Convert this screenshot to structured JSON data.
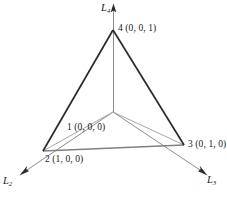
{
  "figure": {
    "background_color": "#ffffff",
    "ink_color": "#1a1a1a",
    "outer_edge_color": "#2b2b2b",
    "base_edge_color": "#808080",
    "interior_line_color": "#a8a8a8",
    "axis_line_color": "#8c8c8c"
  },
  "nodes": {
    "apex": {
      "id": "4",
      "label": "4 (0, 0, 1)",
      "coordinates": "(0, 0, 1)",
      "x": 113,
      "y": 30
    },
    "center": {
      "id": "1",
      "label": "1 (0, 0, 0)",
      "coordinates": "(0, 0, 0)",
      "x": 113,
      "y": 112
    },
    "bottom_left": {
      "id": "2",
      "label": "2 (1, 0, 0)",
      "coordinates": "(1, 0, 0)",
      "x": 43,
      "y": 151
    },
    "bottom_right": {
      "id": "3",
      "label": "3 (0, 1, 0)",
      "coordinates": "(0, 1, 0)",
      "x": 184,
      "y": 145
    }
  },
  "axes": [
    {
      "name": "L4",
      "letter": "L",
      "subscript": "4",
      "direction": "up"
    },
    {
      "name": "L2",
      "letter": "L",
      "subscript": "2",
      "direction": "down-left"
    },
    {
      "name": "L3",
      "letter": "L",
      "subscript": "3",
      "direction": "down-right"
    }
  ]
}
